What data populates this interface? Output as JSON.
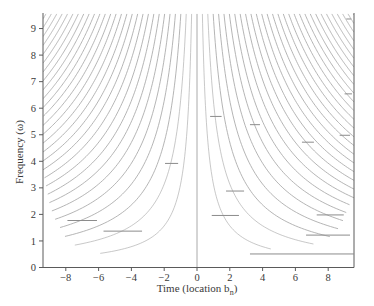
{
  "chart_data": {
    "type": "line",
    "title": "",
    "xlabel": "Time (location b_n)",
    "ylabel": "Frequency (ω)",
    "xlim": [
      -9.4,
      9.6
    ],
    "ylim": [
      0,
      9.55
    ],
    "grid": false,
    "legend": null,
    "xticks": [
      -8,
      -6,
      -4,
      -2,
      0,
      2,
      4,
      6,
      8
    ],
    "xtick_labels": [
      "−8",
      "−6",
      "−4",
      "−2",
      "0",
      "2",
      "4",
      "6",
      "8"
    ],
    "yticks": [
      0,
      1,
      2,
      3,
      4,
      5,
      6,
      7,
      8,
      9
    ],
    "ytick_labels": [
      "0",
      "1",
      "2",
      "3",
      "4",
      "5",
      "6",
      "7",
      "8",
      "9"
    ],
    "curve_family": {
      "description": "hyperbolas ω·|t| = k·π, mirrored about t = 0",
      "constant_per_k": 3.1416,
      "k": [
        1,
        2,
        3,
        4,
        5,
        6,
        7,
        8,
        9,
        10,
        11,
        12,
        13,
        14,
        15,
        16,
        17,
        18,
        19,
        20,
        21,
        22,
        23,
        24,
        25,
        26,
        27,
        28,
        29
      ],
      "left_max_abs_t": [
        5.9,
        7.45,
        8.05,
        8.35,
        8.65,
        8.85,
        9.0,
        9.1,
        9.2,
        9.3
      ],
      "right_max_abs_t": [
        4.5,
        7.1,
        8.1,
        8.6,
        8.9,
        9.1,
        9.3
      ]
    },
    "vertical_line": {
      "t": 0
    },
    "segments": [
      {
        "t_start": -7.9,
        "t_end": -6.1,
        "omega": 1.77
      },
      {
        "t_start": -5.7,
        "t_end": -3.35,
        "omega": 1.37
      },
      {
        "t_start": -1.95,
        "t_end": -1.15,
        "omega": 3.92
      },
      {
        "t_start": 1.77,
        "t_end": 2.87,
        "omega": 2.88
      },
      {
        "t_start": 0.9,
        "t_end": 2.56,
        "omega": 1.96
      },
      {
        "t_start": 7.3,
        "t_end": 8.95,
        "omega": 1.98
      },
      {
        "t_start": 6.65,
        "t_end": 9.33,
        "omega": 1.22
      },
      {
        "t_start": 3.23,
        "t_end": 9.55,
        "omega": 0.51
      },
      {
        "t_start": 0.8,
        "t_end": 1.5,
        "omega": 5.69
      },
      {
        "t_start": 3.23,
        "t_end": 3.84,
        "omega": 5.38
      },
      {
        "t_start": 6.4,
        "t_end": 7.13,
        "omega": 4.72
      },
      {
        "t_start": 8.7,
        "t_end": 9.33,
        "omega": 4.98
      },
      {
        "t_start": 9.0,
        "t_end": 9.45,
        "omega": 6.54
      },
      {
        "t_start": 9.1,
        "t_end": 9.4,
        "omega": 9.36
      }
    ]
  },
  "axes": {
    "xlabel_main": "Time (location b",
    "xlabel_sub": "n",
    "xlabel_close": ")",
    "ylabel": "Frequency (ω)"
  }
}
